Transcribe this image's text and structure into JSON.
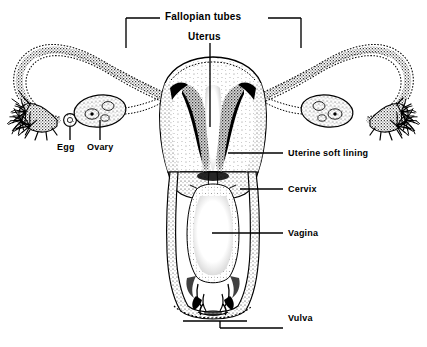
{
  "diagram": {
    "style": "black and white stippled line drawing",
    "background_color": "#ffffff",
    "ink_color": "#000000"
  },
  "labels": {
    "fallopian_tubes": "Fallopian tubes",
    "uterus": "Uterus",
    "egg": "Egg",
    "ovary": "Ovary",
    "uterine_soft_lining": "Uterine soft lining",
    "cervix": "Cervix",
    "vagina": "Vagina",
    "vulva": "Vulva"
  },
  "label_positions": {
    "fallopian_tubes": {
      "x": 168,
      "y": 11,
      "size": 10
    },
    "uterus": {
      "x": 188,
      "y": 31,
      "size": 10
    },
    "egg": {
      "x": 57,
      "y": 146,
      "size": 9
    },
    "ovary": {
      "x": 88,
      "y": 146,
      "size": 9
    },
    "uterine_soft_lining": {
      "x": 286,
      "y": 147,
      "size": 9
    },
    "cervix": {
      "x": 286,
      "y": 183,
      "size": 9
    },
    "vagina": {
      "x": 286,
      "y": 227,
      "size": 9
    },
    "vulva": {
      "x": 286,
      "y": 312,
      "size": 9
    }
  },
  "parts": [
    {
      "name": "left-fallopian-tube",
      "label": "Fallopian tubes"
    },
    {
      "name": "right-fallopian-tube",
      "label": "Fallopian tubes"
    },
    {
      "name": "left-fimbriae",
      "label": ""
    },
    {
      "name": "right-fimbriae",
      "label": ""
    },
    {
      "name": "left-ovary",
      "label": "Ovary"
    },
    {
      "name": "right-ovary",
      "label": "Ovary"
    },
    {
      "name": "egg",
      "label": "Egg"
    },
    {
      "name": "uterus-body",
      "label": "Uterus"
    },
    {
      "name": "endometrium",
      "label": "Uterine soft lining"
    },
    {
      "name": "cervix",
      "label": "Cervix"
    },
    {
      "name": "vaginal-canal",
      "label": "Vagina"
    },
    {
      "name": "vulva",
      "label": "Vulva"
    }
  ]
}
